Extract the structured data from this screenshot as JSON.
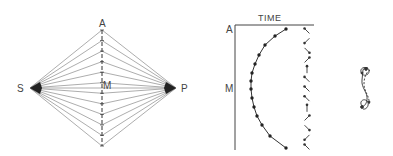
{
  "diagram": {
    "left_figure": {
      "labels": {
        "top": "A",
        "left": "S",
        "right": "P",
        "center": "M"
      },
      "vertices": {
        "A": [
          102,
          30
        ],
        "bottom": [
          102,
          146
        ],
        "S": [
          30,
          88
        ],
        "P": [
          176,
          88
        ]
      },
      "fan_line_count": 11,
      "line_color": "#8a8a8a",
      "node_color": "#222222"
    },
    "middle_figure": {
      "axis_title": "TIME",
      "y_labels": {
        "top": "A",
        "middle": "M"
      },
      "curve_points": [
        [
          286,
          29
        ],
        [
          275,
          36
        ],
        [
          265,
          45
        ],
        [
          259,
          55
        ],
        [
          255,
          64
        ],
        [
          252,
          73
        ],
        [
          251,
          81
        ],
        [
          251,
          89
        ],
        [
          252,
          98
        ],
        [
          254,
          107
        ],
        [
          257,
          116
        ],
        [
          262,
          125
        ],
        [
          270,
          136
        ],
        [
          286,
          148
        ]
      ],
      "arrow_column_x": 307,
      "arrow_directions": [
        "nw",
        "sw",
        "se",
        "ne",
        "n",
        "nw",
        "nw",
        "nw",
        "n",
        "ne",
        "se",
        "sw",
        "nw"
      ]
    },
    "right_figure": {
      "shape": "figure-eight-trace"
    }
  }
}
